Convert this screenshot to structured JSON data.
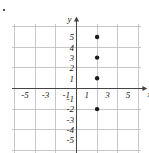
{
  "figure": {
    "marks": {
      "corner_bullet": "•"
    },
    "axis_labels": {
      "x": "x",
      "y": "y"
    }
  },
  "chart_data": {
    "type": "scatter",
    "title": "",
    "xlabel": "x",
    "ylabel": "y",
    "xlim": [
      -6.3,
      6.3
    ],
    "ylim": [
      -6.3,
      6.3
    ],
    "grid": true,
    "grid_step": 1,
    "major_grid_step": 2,
    "legend": "none",
    "x_tick_labels": [
      "-5",
      "-3",
      "-1",
      "1",
      "3",
      "5"
    ],
    "x_tick_values": [
      -5,
      -3,
      -1,
      1,
      3,
      5
    ],
    "y_tick_labels": [
      "5",
      "4",
      "3",
      "2",
      "1",
      "-1",
      "-2",
      "-3",
      "-4",
      "-5"
    ],
    "y_tick_values": [
      5,
      4,
      3,
      2,
      1,
      -1,
      -2,
      -3,
      -4,
      -5
    ],
    "points": [
      {
        "x": 2,
        "y": 5
      },
      {
        "x": 2,
        "y": 3
      },
      {
        "x": 2,
        "y": 1
      },
      {
        "x": 2,
        "y": -2
      }
    ],
    "point_color": "#1a1a1a",
    "axis_color": "#444444",
    "grid_color": "#b9b9b9",
    "minor_grid_color": "#dcdcdc"
  }
}
